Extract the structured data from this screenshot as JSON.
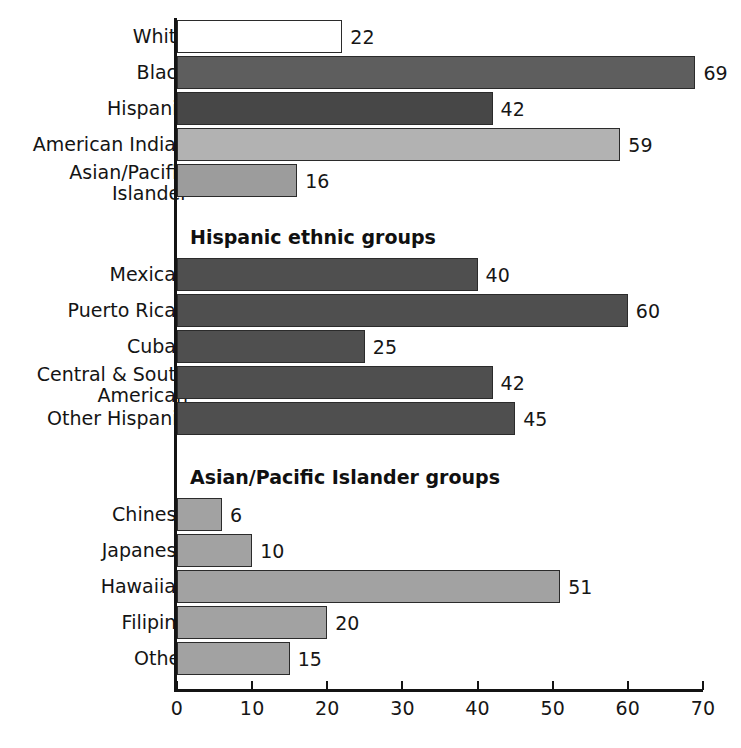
{
  "chart_data": {
    "type": "bar",
    "orientation": "horizontal",
    "title": "",
    "xlabel": "",
    "ylabel": "",
    "xlim": [
      0,
      70
    ],
    "xticks": [
      0,
      10,
      20,
      30,
      40,
      50,
      60,
      70
    ],
    "xtick_labels": [
      "0",
      "10",
      "20",
      "30",
      "40",
      "50",
      "60",
      "70"
    ],
    "grid": false,
    "legend": "none",
    "sections": [
      {
        "heading": "",
        "categories": [
          "White",
          "Black",
          "Hispanic",
          "American Indian",
          "Asian/Pacific\nIslander"
        ],
        "values": [
          22,
          69,
          42,
          59,
          16
        ],
        "value_labels": [
          "22",
          "69",
          "42",
          "59",
          "16"
        ],
        "colors": [
          "#ffffff",
          "#5e5e5e",
          "#474747",
          "#b2b2b2",
          "#9c9c9c"
        ]
      },
      {
        "heading": "Hispanic ethnic groups",
        "categories": [
          "Mexican",
          "Puerto Rican",
          "Cuban",
          "Central & South\nAmerican",
          "Other Hispanic"
        ],
        "values": [
          40,
          60,
          25,
          42,
          45
        ],
        "value_labels": [
          "40",
          "60",
          "25",
          "42",
          "45"
        ],
        "colors": [
          "#4f4f4f",
          "#4f4f4f",
          "#4f4f4f",
          "#4f4f4f",
          "#4f4f4f"
        ]
      },
      {
        "heading": "Asian/Pacific Islander groups",
        "categories": [
          "Chinese",
          "Japanese",
          "Hawaiian",
          "Filipino",
          "Other"
        ],
        "values": [
          6,
          10,
          51,
          20,
          15
        ],
        "value_labels": [
          "6",
          "10",
          "51",
          "20",
          "15"
        ],
        "colors": [
          "#a2a2a2",
          "#a2a2a2",
          "#a2a2a2",
          "#a2a2a2",
          "#a2a2a2"
        ]
      }
    ]
  },
  "axis": {
    "tick_0": "0",
    "tick_10": "10",
    "tick_20": "20",
    "tick_30": "30",
    "tick_40": "40",
    "tick_50": "50",
    "tick_60": "60",
    "tick_70": "70"
  },
  "sections": {
    "hispanic_heading": "Hispanic ethnic groups",
    "asian_heading": "Asian/Pacific Islander groups"
  },
  "rows": {
    "white": {
      "label": "White",
      "value": "22"
    },
    "black": {
      "label": "Black",
      "value": "69"
    },
    "hispanic": {
      "label": "Hispanic",
      "value": "42"
    },
    "american_indian": {
      "label": "American Indian",
      "value": "59"
    },
    "asian_pacific_islander": {
      "label": "Asian/Pacific\nIslander",
      "value": "16"
    },
    "mexican": {
      "label": "Mexican",
      "value": "40"
    },
    "puerto_rican": {
      "label": "Puerto Rican",
      "value": "60"
    },
    "cuban": {
      "label": "Cuban",
      "value": "25"
    },
    "central_south_american": {
      "label": "Central & South\nAmerican",
      "value": "42"
    },
    "other_hispanic": {
      "label": "Other Hispanic",
      "value": "45"
    },
    "chinese": {
      "label": "Chinese",
      "value": "6"
    },
    "japanese": {
      "label": "Japanese",
      "value": "10"
    },
    "hawaiian": {
      "label": "Hawaiian",
      "value": "51"
    },
    "filipino": {
      "label": "Filipino",
      "value": "20"
    },
    "other": {
      "label": "Other",
      "value": "15"
    }
  }
}
